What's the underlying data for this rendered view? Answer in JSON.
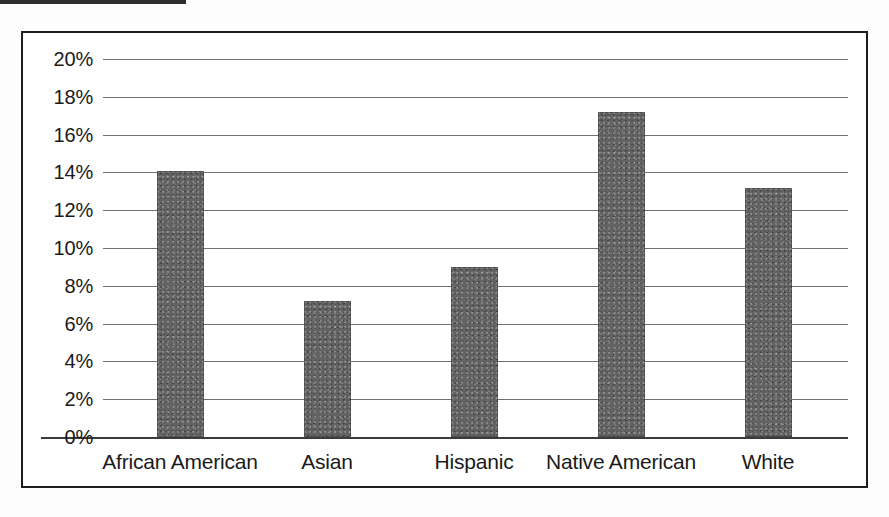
{
  "page": {
    "background_color": "#fdfdfd",
    "frame_color": "#1d1d1d",
    "top_rule_color": "#2e2e2e"
  },
  "chart_data": {
    "type": "bar",
    "title": "",
    "xlabel": "",
    "ylabel": "",
    "categories": [
      "African American",
      "Asian",
      "Hispanic",
      "Native American",
      "White"
    ],
    "values": [
      14.1,
      7.2,
      9.0,
      17.2,
      13.2
    ],
    "value_unit": "%",
    "ylim": [
      0,
      20
    ],
    "ytick_step": 2,
    "ytick_labels": [
      "20%",
      "18%",
      "16%",
      "14%",
      "12%",
      "10%",
      "8%",
      "6%",
      "4%",
      "2%",
      "0%"
    ],
    "ytick_values": [
      20,
      18,
      16,
      14,
      12,
      10,
      8,
      6,
      4,
      2,
      0
    ],
    "grid": true,
    "grid_color": "#6f6f6f",
    "legend": false,
    "bar_color": "#636363",
    "series": [
      {
        "name": "",
        "values": [
          14.1,
          7.2,
          9.0,
          17.2,
          13.2
        ]
      }
    ]
  }
}
